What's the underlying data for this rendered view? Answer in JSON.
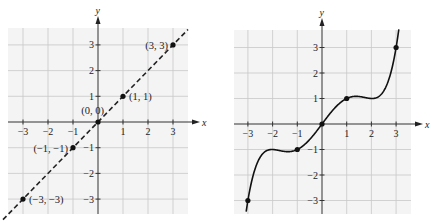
{
  "chart_data": [
    {
      "type": "line",
      "title": "",
      "xlabel": "x",
      "ylabel": "y",
      "xlim": [
        -3.5,
        3.5
      ],
      "ylim": [
        -3.5,
        3.5
      ],
      "grid": true,
      "x_ticks": [
        "-3",
        "-2",
        "-1",
        "1",
        "2",
        "3"
      ],
      "y_ticks": [
        "3",
        "2",
        "1",
        "-1",
        "-2",
        "-3"
      ],
      "line_style": "dashed",
      "function": "y = x",
      "points": [
        {
          "x": -3,
          "y": -3,
          "label": "(−3, −3)"
        },
        {
          "x": -1,
          "y": -1,
          "label": "(−1, −1)"
        },
        {
          "x": 0,
          "y": 0,
          "label": "(0, 0)"
        },
        {
          "x": 1,
          "y": 1,
          "label": "(1, 1)"
        },
        {
          "x": 3,
          "y": 3,
          "label": "(3, 3)"
        }
      ]
    },
    {
      "type": "line",
      "title": "",
      "xlabel": "x",
      "ylabel": "y",
      "xlim": [
        -3.5,
        3.5
      ],
      "ylim": [
        -3.5,
        3.5
      ],
      "grid": true,
      "x_ticks": [
        "-3",
        "-2",
        "-1",
        "1",
        "2",
        "3"
      ],
      "y_ticks": [
        "3",
        "2",
        "1",
        "-1",
        "-2",
        "-3"
      ],
      "line_style": "solid",
      "function": "odd polynomial through (-3,-3),(-1,-1),(0,0),(1,1),(3,3) with local max near (1.4,1.08) and local min at (2,1)",
      "points": [
        {
          "x": -3,
          "y": -3
        },
        {
          "x": -1,
          "y": -1
        },
        {
          "x": 0,
          "y": 0
        },
        {
          "x": 1,
          "y": 1
        },
        {
          "x": 3,
          "y": 3
        }
      ]
    }
  ],
  "labels": {
    "x_axis": "x",
    "y_axis": "y",
    "ticks": {
      "m3": "−3",
      "m2": "−2",
      "m1": "−1",
      "p1": "1",
      "p2": "2",
      "p3": "3"
    },
    "left_points": {
      "p_m3": "(−3, −3)",
      "p_m1": "(−1, −1)",
      "p_0": "(0, 0)",
      "p_1": "(1, 1)",
      "p_3": "(3, 3)"
    }
  }
}
